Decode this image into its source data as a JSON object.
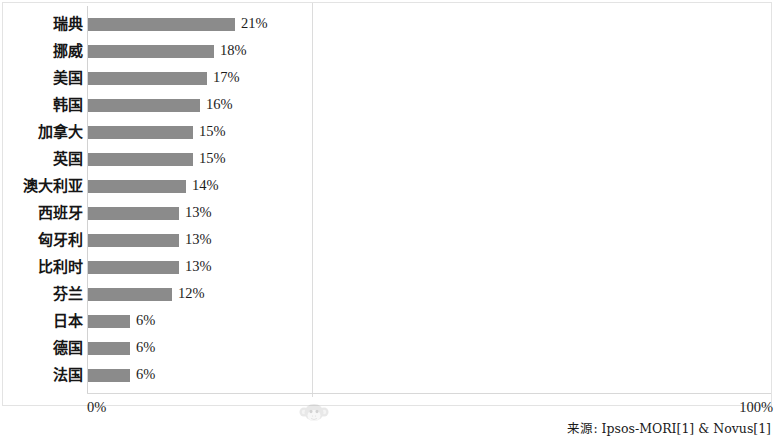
{
  "chart_data": {
    "type": "bar",
    "orientation": "horizontal",
    "title": "",
    "subtitle": "",
    "xlabel": "",
    "ylabel": "",
    "xlim": [
      0,
      100
    ],
    "xticks": [
      "0%",
      "100%"
    ],
    "grid": true,
    "gridlines": [
      "50%"
    ],
    "legend": null,
    "value_label_suffix": "%",
    "categories": [
      "瑞典",
      "挪威",
      "美国",
      "韩国",
      "加拿大",
      "英国",
      "澳大利亚",
      "西班牙",
      "匈牙利",
      "比利时",
      "芬兰",
      "日本",
      "德国",
      "法国"
    ],
    "values": [
      21,
      18,
      17,
      16,
      15,
      15,
      14,
      13,
      13,
      13,
      12,
      6,
      6,
      6
    ],
    "value_labels": [
      "21%",
      "18%",
      "17%",
      "16%",
      "15%",
      "15%",
      "14%",
      "13%",
      "13%",
      "13%",
      "12%",
      "6%",
      "6%",
      "6%"
    ],
    "bar_color": "#8b8b8b",
    "axis_color": "#d2d2d2",
    "background_color": "#ffffff"
  },
  "axis": {
    "left_tick_label": "0%",
    "right_tick_label": "100%"
  },
  "footer": {
    "source": "来源: Ipsos-MORI[1] & Novus[1]"
  },
  "watermark": {
    "icon": "monkey-face-icon"
  }
}
